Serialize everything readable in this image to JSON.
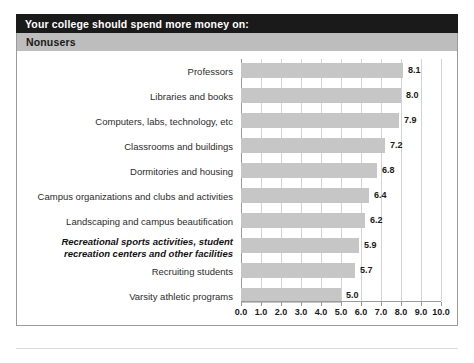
{
  "header": {
    "title": "Your college should spend more money on:",
    "subtitle": "Nonusers"
  },
  "chart_data": {
    "type": "bar",
    "orientation": "horizontal",
    "title": "Your college should spend more money on:",
    "subtitle": "Nonusers",
    "xlabel": "",
    "ylabel": "",
    "xlim": [
      0.0,
      10.0
    ],
    "grid": true,
    "legend": null,
    "tick_labels": [
      "0.0",
      "1.0",
      "2.0",
      "3.0",
      "4.0",
      "5.0",
      "6.0",
      "7.0",
      "8.0",
      "9.0",
      "10.0"
    ],
    "ticks": [
      0,
      1,
      2,
      3,
      4,
      5,
      6,
      7,
      8,
      9,
      10
    ],
    "categories": [
      "Professors",
      "Libraries and books",
      "Computers, labs, technology, etc",
      "Classrooms and buildings",
      "Dormitories and housing",
      "Campus organizations and clubs and activities",
      "Landscaping and campus beautification",
      "Recreational sports activities, student recreation centers and other facilities",
      "Recruiting students",
      "Varsity athletic programs"
    ],
    "values": [
      8.1,
      8.0,
      7.9,
      7.2,
      6.8,
      6.4,
      6.2,
      5.9,
      5.7,
      5.0
    ],
    "value_labels": [
      "8.1",
      "8.0",
      "7.9",
      "7.2",
      "6.8",
      "6.4",
      "6.2",
      "5.9",
      "5.7",
      "5.0"
    ],
    "highlighted_index": 7,
    "highlighted_lines": [
      "Recreational sports activities, student",
      "recreation centers and other facilities"
    ],
    "bar_color": "#c6c6c6",
    "grid_color": "#d3d3d3",
    "axis_color": "#9a9a9a",
    "title_bar_color": "#1a1a1a",
    "subtitle_bar_color": "#bdbdbd"
  }
}
